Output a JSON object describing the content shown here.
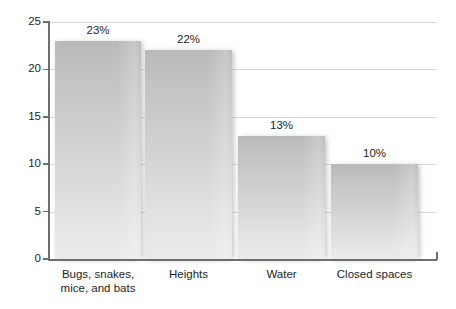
{
  "chart_data": {
    "type": "bar",
    "title": "",
    "subtitle": "",
    "xlabel": "",
    "ylabel": "",
    "categories": [
      "Bugs, snakes,\nmice, and bats",
      "Heights",
      "Water",
      "Closed spaces"
    ],
    "values": [
      23,
      22,
      13,
      10
    ],
    "data_labels": [
      "23%",
      "22%",
      "13%",
      "10%"
    ],
    "ylim": [
      0,
      25
    ],
    "yticks": [
      0,
      5,
      10,
      15,
      20,
      25
    ],
    "ytick_labels": [
      "0",
      "5",
      "10",
      "15",
      "20",
      "25"
    ],
    "grid": true,
    "grid_axis": "y",
    "legend": false,
    "legend_position": "none",
    "orientation": "vertical",
    "bar_color": "#cfcfcf",
    "grid_color": "#d8d8d8",
    "axis_color": "#6e6e6e",
    "text_color": "#1e1e1e",
    "background_color": "#ffffff"
  }
}
